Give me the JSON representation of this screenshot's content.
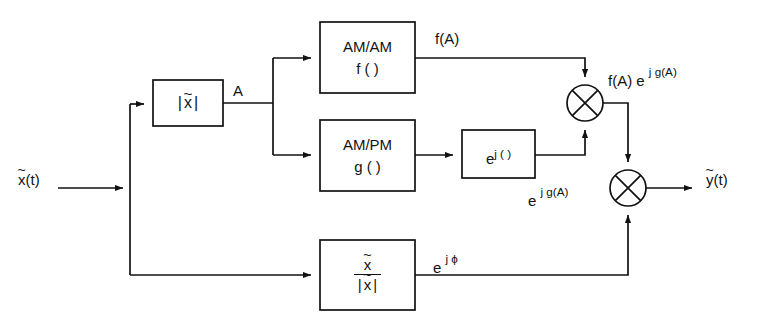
{
  "diagram": {
    "background_color": "#ffffff",
    "line_color": "#121212",
    "blocks": [
      {
        "id": "envelope",
        "name": "envelope-magnitude-block",
        "label_lines": [
          "|x|"
        ],
        "x": 153,
        "y": 80,
        "w": 70,
        "h": 46
      },
      {
        "id": "amam",
        "name": "am-am-block",
        "label_lines": [
          "AM/AM",
          "f ( )"
        ],
        "x": 320,
        "y": 22,
        "w": 95,
        "h": 71
      },
      {
        "id": "ampm",
        "name": "am-pm-block",
        "label_lines": [
          "AM/PM",
          "g ( )"
        ],
        "x": 320,
        "y": 120,
        "w": 95,
        "h": 71
      },
      {
        "id": "expj",
        "name": "complex-exponential-block",
        "label_lines": [
          "e j ( )"
        ],
        "x": 462,
        "y": 130,
        "w": 73,
        "h": 48
      },
      {
        "id": "phase",
        "name": "phase-normalizer-block",
        "label_lines": [
          "x",
          "|x|"
        ],
        "x": 320,
        "y": 240,
        "w": 95,
        "h": 70
      }
    ],
    "multipliers": [
      {
        "id": "mult1",
        "name": "multiplier-node-upper",
        "cx": 585,
        "cy": 103,
        "r": 18
      },
      {
        "id": "mult2",
        "name": "multiplier-node-lower",
        "cx": 628,
        "cy": 188,
        "r": 18
      }
    ],
    "signal_labels": {
      "input": "x(t)",
      "input_base": "x",
      "input_suffix": "(t)",
      "output": "y(t)",
      "output_base": "y",
      "output_suffix": "(t)",
      "amplitude": "A",
      "fa": "f(A)",
      "expjga": "e",
      "expjga_sup": "j g(A)",
      "fa_expjga_prefix": "f(A) e",
      "fa_expjga_sup": "j g(A)",
      "expjphi_base": "e",
      "expjphi_sup": "j ϕ"
    },
    "block_text": {
      "envelope_bar_left": "|",
      "envelope_var": "x",
      "envelope_bar_right": "|",
      "amam_line1": "AM/AM",
      "amam_line2": "f ( )",
      "ampm_line1": "AM/PM",
      "ampm_line2": "g ( )",
      "expj_base": "e",
      "expj_sup": "j ( )",
      "phase_num": "x",
      "phase_den_bar_left": "|",
      "phase_den_var": "x",
      "phase_den_bar_right": "|",
      "tilde": "~"
    }
  }
}
